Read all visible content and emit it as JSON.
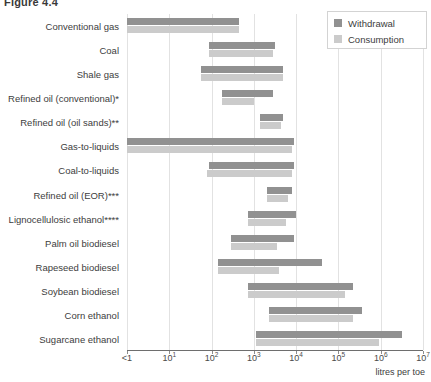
{
  "figure": {
    "title": "Figure 4.4"
  },
  "legend": {
    "position": "top-right",
    "entries": [
      {
        "label": "Withdrawal",
        "color": "#919191"
      },
      {
        "label": "Consumption",
        "color": "#cbcbcb"
      }
    ]
  },
  "axis": {
    "xlabel": "litres per toe",
    "scale": "log",
    "ticks": [
      {
        "text": "<1",
        "exp": "",
        "base": "<1",
        "value": 0
      },
      {
        "text": "10^1",
        "base": "10",
        "exp": "1",
        "value": 1
      },
      {
        "text": "10^2",
        "base": "10",
        "exp": "2",
        "value": 2
      },
      {
        "text": "10^3",
        "base": "10",
        "exp": "3",
        "value": 3
      },
      {
        "text": "10^4",
        "base": "10",
        "exp": "4",
        "value": 4
      },
      {
        "text": "10^5",
        "base": "10",
        "exp": "5",
        "value": 5
      },
      {
        "text": "10^6",
        "base": "10",
        "exp": "6",
        "value": 6
      },
      {
        "text": "10^7",
        "base": "10",
        "exp": "7",
        "value": 7
      }
    ]
  },
  "chart_data": {
    "type": "bar",
    "orientation": "horizontal",
    "subtype": "floating-range-bar",
    "title": "Figure 4.4",
    "xlabel": "litres per toe",
    "ylabel": "",
    "xscale": "log",
    "xlim": [
      0,
      7
    ],
    "xtick_labels": [
      "<1",
      "10¹",
      "10²",
      "10³",
      "10⁴",
      "10⁵",
      "10⁶",
      "10⁷"
    ],
    "grid": true,
    "legend": [
      "Withdrawal",
      "Consumption"
    ],
    "note": "Values are log10 exponents of litres per toe; each bar spans a low-to-high range.",
    "categories": [
      "Conventional gas",
      "Coal",
      "Shale gas",
      "Refined oil (conventional)*",
      "Refined oil (oil sands)**",
      "Gas-to-liquids",
      "Coal-to-liquids",
      "Refined oil (EOR)***",
      "Lignocellulosic ethanol****",
      "Palm oil biodiesel",
      "Rapeseed biodiesel",
      "Soybean biodiesel",
      "Corn ethanol",
      "Sugarcane ethanol"
    ],
    "series": [
      {
        "name": "Withdrawal",
        "color": "#919191",
        "ranges": [
          [
            0.0,
            2.65
          ],
          [
            1.95,
            3.5
          ],
          [
            1.75,
            3.7
          ],
          [
            2.25,
            3.45
          ],
          [
            3.15,
            3.7
          ],
          [
            0.0,
            3.95
          ],
          [
            1.95,
            3.95
          ],
          [
            3.3,
            3.9
          ],
          [
            2.85,
            4.0
          ],
          [
            2.45,
            3.95
          ],
          [
            2.15,
            4.6
          ],
          [
            2.85,
            5.35
          ],
          [
            3.35,
            5.55
          ],
          [
            3.05,
            6.5
          ]
        ]
      },
      {
        "name": "Consumption",
        "color": "#cbcbcb",
        "ranges": [
          [
            0.0,
            2.65
          ],
          [
            1.95,
            3.45
          ],
          [
            1.75,
            3.7
          ],
          [
            2.25,
            3.0
          ],
          [
            3.15,
            3.65
          ],
          [
            0.0,
            3.9
          ],
          [
            1.9,
            3.9
          ],
          [
            3.3,
            3.8
          ],
          [
            2.85,
            3.75
          ],
          [
            2.45,
            3.55
          ],
          [
            2.15,
            3.6
          ],
          [
            2.85,
            5.15
          ],
          [
            3.35,
            5.35
          ],
          [
            3.05,
            5.95
          ]
        ]
      }
    ]
  }
}
